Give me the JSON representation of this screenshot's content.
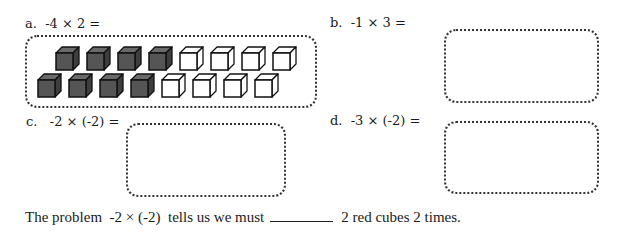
{
  "problems": [
    {
      "letter": "a.",
      "expression": "-4 × 2 =",
      "label_full": "a.  -4 × 2 ="
    },
    {
      "letter": "b.",
      "expression": "-1 × 3 =",
      "label_full": "b.  -1 × 3 ="
    },
    {
      "letter": "c.",
      "expression": "-2 × (-2) =",
      "label_full": "c.   -2 × (-2) ="
    },
    {
      "letter": "d.",
      "expression": "-3 × (-2) =",
      "label_full": "d.  -3 × (-2) ="
    }
  ],
  "cubes": {
    "row1": [
      "filled",
      "filled",
      "filled",
      "filled",
      "empty",
      "empty",
      "empty",
      "empty"
    ],
    "row2": [
      "filled",
      "filled",
      "filled",
      "filled",
      "empty",
      "empty",
      "empty",
      "empty"
    ],
    "filled_color": "#555555",
    "empty_color": "#ffffff"
  },
  "sentence": {
    "before": "The problem  -2 × (-2)  tells us we must",
    "blank": "",
    "after": "2 red cubes 2 times."
  }
}
